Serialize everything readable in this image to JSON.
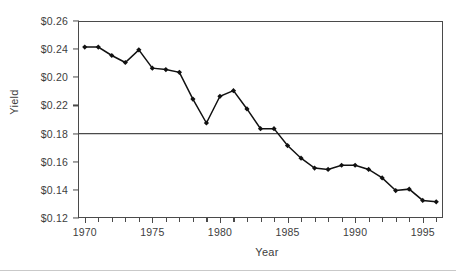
{
  "chart_data": {
    "type": "line",
    "title": "",
    "xlabel": "Year",
    "ylabel": "Yield",
    "grid": false,
    "legend": null,
    "xlim": [
      1969.5,
      1996.5
    ],
    "ylim": [
      0.12,
      0.26
    ],
    "xticks": [
      1970,
      1975,
      1980,
      1985,
      1990,
      1995
    ],
    "xticklabels": [
      "1970",
      "1975",
      "1980",
      "1985",
      "1990",
      "1995"
    ],
    "x_minor_tick_interval": 1,
    "yticks": [
      0.26,
      0.24,
      0.22,
      0.2,
      0.18,
      0.16,
      0.14,
      0.12
    ],
    "yticklabels": [
      "$0.26",
      "$0.24",
      "$0.20",
      "$0.22",
      "$0.18",
      "$0.16",
      "$0.14",
      "$0.12"
    ],
    "ytick_label_note": "Labels printed in original image are out of order: third is $0.20 and fourth is $0.22",
    "reference_line": {
      "y": 0.18,
      "label": "",
      "color": "#4a4a4a"
    },
    "marker": "filled-diamond",
    "line_color": "#111111",
    "marker_color": "#111111",
    "x": [
      1970,
      1971,
      1972,
      1973,
      1974,
      1975,
      1976,
      1977,
      1978,
      1979,
      1980,
      1981,
      1982,
      1983,
      1984,
      1985,
      1986,
      1987,
      1988,
      1989,
      1990,
      1991,
      1992,
      1993,
      1994,
      1995,
      1996
    ],
    "values": [
      0.2415,
      0.2415,
      0.2355,
      0.2305,
      0.2395,
      0.2265,
      0.2255,
      0.2235,
      0.2045,
      0.1875,
      0.2065,
      0.2105,
      0.1975,
      0.1835,
      0.1835,
      0.1715,
      0.1625,
      0.1555,
      0.1545,
      0.1575,
      0.1575,
      0.1545,
      0.1485,
      0.1395,
      0.1405,
      0.1325,
      0.1315
    ],
    "series_name": "Yield"
  },
  "axis": {
    "y_title": "Yield",
    "x_title": "Year"
  }
}
